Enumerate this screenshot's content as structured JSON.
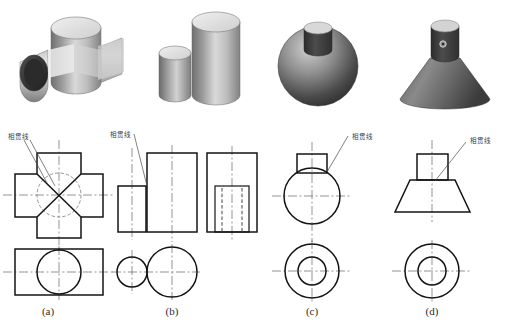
{
  "figure": {
    "background_color": "#ffffff",
    "line_color": "#1a1a1a",
    "center_line_color": "#555555",
    "hidden_line_color": "#444444"
  },
  "annotations": {
    "intersection_line_label": "相贯线",
    "labels": [
      {
        "id": "a",
        "text": "相贯线",
        "x": 8,
        "y": 131
      },
      {
        "id": "b",
        "text": "相贯线",
        "x": 110,
        "y": 129
      },
      {
        "id": "c",
        "text": "相贯线",
        "x": 352,
        "y": 131
      },
      {
        "id": "d",
        "text": "相贯线",
        "x": 470,
        "y": 135
      }
    ]
  },
  "captions": [
    {
      "id": "a",
      "text": "(a)",
      "x": 48,
      "y": 307
    },
    {
      "id": "b",
      "text": "(b)",
      "x": 172,
      "y": 307
    },
    {
      "id": "c",
      "text": "(c)",
      "x": 312,
      "y": 307
    },
    {
      "id": "d",
      "text": "(d)",
      "x": 432,
      "y": 307
    }
  ],
  "solids": [
    {
      "id": "a",
      "name": "two-perpendicular-intersecting-cylinders",
      "description": "两正交圆柱相贯",
      "render_box": {
        "x": 20,
        "y": 5,
        "w": 112,
        "h": 105
      }
    },
    {
      "id": "b",
      "name": "two-parallel-cylinders-different-diameter",
      "description": "两平行圆柱",
      "render_box": {
        "x": 150,
        "y": 5,
        "w": 92,
        "h": 105
      }
    },
    {
      "id": "c",
      "name": "sphere-with-cylinder",
      "description": "球与圆柱相贯",
      "render_box": {
        "x": 272,
        "y": 5,
        "w": 100,
        "h": 105
      }
    },
    {
      "id": "d",
      "name": "cone-with-cylinder",
      "description": "圆锥与圆柱相贯",
      "render_box": {
        "x": 395,
        "y": 5,
        "w": 100,
        "h": 105
      }
    }
  ],
  "projections": [
    {
      "id": "a",
      "front_view": "cross-shape-with-x-intersection-lines-and-hidden-circle",
      "top_view": "rectangle-with-circle"
    },
    {
      "id": "b",
      "front_view": "two-rectangles-side-by-side",
      "side_view": "rectangle-with-hidden-lines",
      "top_view": "two-tangent-circles"
    },
    {
      "id": "c",
      "front_view": "circle-with-small-rectangle-on-top",
      "top_view": "concentric-circles"
    },
    {
      "id": "d",
      "front_view": "trapezoid-with-rectangle-on-top",
      "top_view": "concentric-circles"
    }
  ]
}
